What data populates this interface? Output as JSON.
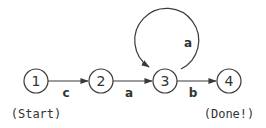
{
  "diagram": {
    "type": "state-machine",
    "nodes": [
      {
        "id": "1",
        "label": "1",
        "caption": "(Start)"
      },
      {
        "id": "2",
        "label": "2"
      },
      {
        "id": "3",
        "label": "3"
      },
      {
        "id": "4",
        "label": "4",
        "caption": "(Done!)"
      }
    ],
    "edges": [
      {
        "from": "1",
        "to": "2",
        "label": "c"
      },
      {
        "from": "2",
        "to": "3",
        "label": "a"
      },
      {
        "from": "3",
        "to": "4",
        "label": "b"
      },
      {
        "from": "3",
        "to": "3",
        "label": "a"
      }
    ],
    "colors": {
      "stroke": "#3a3a3a",
      "text": "#333333",
      "background": "#ffffff"
    }
  }
}
